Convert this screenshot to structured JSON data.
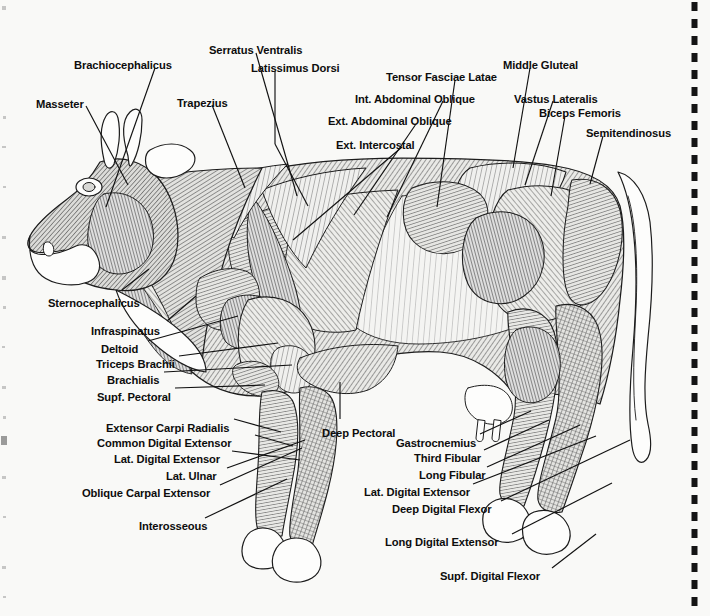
{
  "page": {
    "background_color": "#f9f9f7",
    "ink_color": "#111111",
    "view": "left lateral",
    "has_right_perforation_strip": true
  },
  "labels": {
    "masseter": "Masseter",
    "brachiocephalicus": "Brachiocephalicus",
    "trapezius": "Trapezius",
    "serratus_ventralis": "Serratus Ventralis",
    "latissimus_dorsi": "Latissimus Dorsi",
    "tensor_fasciae_latae": "Tensor Fasciae Latae",
    "int_abdominal_oblique": "Int. Abdominal Oblique",
    "ext_abdominal_oblique": "Ext. Abdominal Oblique",
    "ext_intercostal": "Ext. Intercostal",
    "middle_gluteal": "Middle Gluteal",
    "vastus_lateralis": "Vastus Lateralis",
    "biceps_femoris": "Biceps Femoris",
    "semitendinosus": "Semitendinosus",
    "sternocephalicus": "Sternocephalicus",
    "infraspinatus": "Infraspinatus",
    "deltoid": "Deltoid",
    "triceps_brachii": "Triceps Brachii",
    "brachialis": "Brachialis",
    "supf_pectoral": "Supf. Pectoral",
    "extensor_carpi_radialis": "Extensor Carpi Radialis",
    "common_digital_extensor": "Common Digital Extensor",
    "lat_digital_extensor_fore": "Lat. Digital Extensor",
    "lat_ulnar": "Lat. Ulnar",
    "oblique_carpal_extensor": "Oblique Carpal Extensor",
    "interosseous": "Interosseous",
    "deep_pectoral": "Deep Pectoral",
    "gastrocnemius": "Gastrocnemius",
    "third_fibular": "Third Fibular",
    "long_fibular": "Long Fibular",
    "lat_digital_extensor_hind": "Lat. Digital Extensor",
    "deep_digital_flexor": "Deep Digital Flexor",
    "long_digital_extensor": "Long Digital Extensor",
    "supf_digital_flexor": "Supf. Digital Flexor"
  },
  "label_layout": [
    {
      "key": "masseter",
      "text": "Masseter",
      "x": 36,
      "y": 99,
      "align": "left"
    },
    {
      "key": "brachiocephalicus",
      "text": "Brachiocephalicus",
      "x": 74,
      "y": 60,
      "align": "left"
    },
    {
      "key": "trapezius",
      "text": "Trapezius",
      "x": 177,
      "y": 98,
      "align": "left"
    },
    {
      "key": "serratus_ventralis",
      "text": "Serratus Ventralis",
      "x": 209,
      "y": 45,
      "align": "left"
    },
    {
      "key": "latissimus_dorsi",
      "text": "Latissimus Dorsi",
      "x": 251,
      "y": 63,
      "align": "left"
    },
    {
      "key": "tensor_fasciae_latae",
      "text": "Tensor Fasciae Latae",
      "x": 386,
      "y": 72,
      "align": "left"
    },
    {
      "key": "int_abdominal_oblique",
      "text": "Int. Abdominal Oblique",
      "x": 355,
      "y": 94,
      "align": "left"
    },
    {
      "key": "ext_abdominal_oblique",
      "text": "Ext. Abdominal Oblique",
      "x": 328,
      "y": 116,
      "align": "left"
    },
    {
      "key": "ext_intercostal",
      "text": "Ext. Intercostal",
      "x": 336,
      "y": 140,
      "align": "left"
    },
    {
      "key": "middle_gluteal",
      "text": "Middle Gluteal",
      "x": 503,
      "y": 60,
      "align": "left"
    },
    {
      "key": "vastus_lateralis",
      "text": "Vastus Lateralis",
      "x": 514,
      "y": 94,
      "align": "left"
    },
    {
      "key": "biceps_femoris",
      "text": "Biceps Femoris",
      "x": 539,
      "y": 108,
      "align": "left"
    },
    {
      "key": "semitendinosus",
      "text": "Semitendinosus",
      "x": 586,
      "y": 128,
      "align": "left"
    },
    {
      "key": "sternocephalicus",
      "text": "Sternocephalicus",
      "x": 48,
      "y": 298,
      "align": "left"
    },
    {
      "key": "infraspinatus",
      "text": "Infraspinatus",
      "x": 91,
      "y": 326,
      "align": "left"
    },
    {
      "key": "deltoid",
      "text": "Deltoid",
      "x": 101,
      "y": 344,
      "align": "left"
    },
    {
      "key": "triceps_brachii",
      "text": "Triceps Brachii",
      "x": 96,
      "y": 359,
      "align": "left"
    },
    {
      "key": "brachialis",
      "text": "Brachialis",
      "x": 107,
      "y": 375,
      "align": "left"
    },
    {
      "key": "supf_pectoral",
      "text": "Supf. Pectoral",
      "x": 97,
      "y": 392,
      "align": "left"
    },
    {
      "key": "extensor_carpi_radialis",
      "text": "Extensor Carpi Radialis",
      "x": 106,
      "y": 423,
      "align": "left"
    },
    {
      "key": "common_digital_extensor",
      "text": "Common Digital Extensor",
      "x": 97,
      "y": 438,
      "align": "left"
    },
    {
      "key": "lat_digital_extensor_fore",
      "text": "Lat. Digital Extensor",
      "x": 114,
      "y": 454,
      "align": "left"
    },
    {
      "key": "lat_ulnar",
      "text": "Lat. Ulnar",
      "x": 166,
      "y": 471,
      "align": "left"
    },
    {
      "key": "oblique_carpal_extensor",
      "text": "Oblique Carpal Extensor",
      "x": 82,
      "y": 488,
      "align": "left"
    },
    {
      "key": "interosseous",
      "text": "Interosseous",
      "x": 139,
      "y": 521,
      "align": "left"
    },
    {
      "key": "deep_pectoral",
      "text": "Deep Pectoral",
      "x": 322,
      "y": 428,
      "align": "left"
    },
    {
      "key": "gastrocnemius",
      "text": "Gastrocnemius",
      "x": 396,
      "y": 438,
      "align": "left"
    },
    {
      "key": "third_fibular",
      "text": "Third Fibular",
      "x": 414,
      "y": 453,
      "align": "left"
    },
    {
      "key": "long_fibular",
      "text": "Long Fibular",
      "x": 419,
      "y": 470,
      "align": "left"
    },
    {
      "key": "lat_digital_extensor_hind",
      "text": "Lat. Digital Extensor",
      "x": 364,
      "y": 487,
      "align": "left"
    },
    {
      "key": "deep_digital_flexor",
      "text": "Deep Digital Flexor",
      "x": 392,
      "y": 504,
      "align": "left"
    },
    {
      "key": "long_digital_extensor",
      "text": "Long Digital Extensor",
      "x": 385,
      "y": 537,
      "align": "left"
    },
    {
      "key": "supf_digital_flexor",
      "text": "Supf. Digital Flexor",
      "x": 440,
      "y": 571,
      "align": "left"
    }
  ],
  "leader_lines": [
    {
      "key": "masseter",
      "x1": 86,
      "y1": 106,
      "x2": 128,
      "y2": 185
    },
    {
      "key": "brachiocephalicus",
      "x1": 155,
      "y1": 68,
      "x2": 106,
      "y2": 207
    },
    {
      "key": "trapezius",
      "x1": 212,
      "y1": 105,
      "x2": 245,
      "y2": 188
    },
    {
      "key": "serratus_ventralis",
      "x1": 256,
      "y1": 53,
      "x2": 297,
      "y2": 196
    },
    {
      "key": "latissimus_dorsi",
      "x1": 275,
      "y1": 71,
      "x2": 275,
      "y2": 144
    },
    {
      "key": "latissimus_dorsi_b",
      "x1": 275,
      "y1": 144,
      "x2": 308,
      "y2": 206
    },
    {
      "key": "tensor_fasciae_latae",
      "x1": 455,
      "y1": 80,
      "x2": 437,
      "y2": 207
    },
    {
      "key": "int_abdominal_oblique",
      "x1": 443,
      "y1": 101,
      "x2": 387,
      "y2": 217
    },
    {
      "key": "ext_abdominal_oblique",
      "x1": 416,
      "y1": 124,
      "x2": 354,
      "y2": 215
    },
    {
      "key": "ext_intercostal",
      "x1": 402,
      "y1": 147,
      "x2": 293,
      "y2": 240
    },
    {
      "key": "middle_gluteal",
      "x1": 530,
      "y1": 68,
      "x2": 513,
      "y2": 168
    },
    {
      "key": "vastus_lateralis",
      "x1": 553,
      "y1": 101,
      "x2": 525,
      "y2": 185
    },
    {
      "key": "biceps_femoris",
      "x1": 565,
      "y1": 116,
      "x2": 551,
      "y2": 196
    },
    {
      "key": "semitendinosus",
      "x1": 603,
      "y1": 136,
      "x2": 590,
      "y2": 184
    },
    {
      "key": "sternocephalicus",
      "x1": 122,
      "y1": 290,
      "x2": 149,
      "y2": 269
    },
    {
      "key": "infraspinatus",
      "x1": 167,
      "y1": 321,
      "x2": 196,
      "y2": 296
    },
    {
      "key": "deltoid",
      "x1": 148,
      "y1": 341,
      "x2": 238,
      "y2": 316
    },
    {
      "key": "triceps_brachii",
      "x1": 179,
      "y1": 356,
      "x2": 278,
      "y2": 343
    },
    {
      "key": "brachialis",
      "x1": 164,
      "y1": 372,
      "x2": 292,
      "y2": 365
    },
    {
      "key": "supf_pectoral",
      "x1": 175,
      "y1": 388,
      "x2": 265,
      "y2": 385
    },
    {
      "key": "extensor_carpi_radialis",
      "x1": 234,
      "y1": 419,
      "x2": 281,
      "y2": 432
    },
    {
      "key": "common_digital_extensor",
      "x1": 255,
      "y1": 435,
      "x2": 293,
      "y2": 446
    },
    {
      "key": "lat_digital_extensor_fore",
      "x1": 232,
      "y1": 451,
      "x2": 300,
      "y2": 460
    },
    {
      "key": "lat_ulnar",
      "x1": 227,
      "y1": 468,
      "x2": 305,
      "y2": 440
    },
    {
      "key": "oblique_carpal_extensor",
      "x1": 220,
      "y1": 485,
      "x2": 302,
      "y2": 448
    },
    {
      "key": "interosseous",
      "x1": 205,
      "y1": 518,
      "x2": 287,
      "y2": 479
    },
    {
      "key": "deep_pectoral",
      "x1": 340,
      "y1": 419,
      "x2": 340,
      "y2": 382
    },
    {
      "key": "gastrocnemius",
      "x1": 480,
      "y1": 434,
      "x2": 531,
      "y2": 411
    },
    {
      "key": "third_fibular",
      "x1": 484,
      "y1": 450,
      "x2": 549,
      "y2": 420
    },
    {
      "key": "long_fibular",
      "x1": 487,
      "y1": 467,
      "x2": 580,
      "y2": 425
    },
    {
      "key": "lat_digital_extensor_hind",
      "x1": 473,
      "y1": 484,
      "x2": 596,
      "y2": 436
    },
    {
      "key": "deep_digital_flexor",
      "x1": 501,
      "y1": 501,
      "x2": 630,
      "y2": 440
    },
    {
      "key": "long_digital_extensor",
      "x1": 512,
      "y1": 534,
      "x2": 612,
      "y2": 483
    },
    {
      "key": "supf_digital_flexor",
      "x1": 552,
      "y1": 568,
      "x2": 596,
      "y2": 534
    }
  ]
}
